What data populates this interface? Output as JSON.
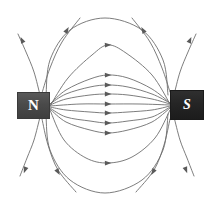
{
  "figure": {
    "background_color": "#ffffff",
    "width": 211,
    "height": 209
  },
  "poles": {
    "north": {
      "label": "N",
      "name": "north-pole",
      "fill_color": "#4a4a4a",
      "text_color": "#ffffff",
      "x": 17,
      "y": 92,
      "width": 33,
      "height": 27
    },
    "south": {
      "label": "S",
      "name": "south-pole",
      "fill_color": "#242424",
      "text_color": "#ffffff",
      "x": 170,
      "y": 90,
      "width": 34,
      "height": 30
    }
  },
  "field": {
    "line_color": "#6e6e6e",
    "line_width": 0.9,
    "arrow_color": "#5a5a5a",
    "direction": "north-to-south",
    "inner_line_count": 7,
    "outer_line_count": 8,
    "open_line_count": 4
  },
  "chart_data": {
    "type": "line",
    "xlabel": "",
    "ylabel": "",
    "xlim": [
      0,
      211
    ],
    "ylim": [
      0,
      209
    ],
    "grid": false,
    "legend": null,
    "annotations": [
      {
        "text": "N",
        "x": 33,
        "y": 106
      },
      {
        "text": "S",
        "x": 187,
        "y": 105
      }
    ],
    "series": [
      {
        "name": "inner-line-1",
        "arrow_at": {
          "x": 108,
          "y": 45
        },
        "points": [
          [
            50,
            106
          ],
          [
            68,
            78
          ],
          [
            92,
            55
          ],
          [
            108,
            45
          ],
          [
            126,
            53
          ],
          [
            152,
            75
          ],
          [
            170,
            104
          ]
        ]
      },
      {
        "name": "inner-line-2",
        "arrow_at": {
          "x": 108,
          "y": 75
        },
        "points": [
          [
            50,
            104
          ],
          [
            66,
            90
          ],
          [
            90,
            79
          ],
          [
            108,
            75
          ],
          [
            128,
            78
          ],
          [
            152,
            89
          ],
          [
            170,
            103
          ]
        ]
      },
      {
        "name": "inner-line-3",
        "arrow_at": {
          "x": 108,
          "y": 85
        },
        "points": [
          [
            50,
            104
          ],
          [
            66,
            94
          ],
          [
            90,
            87
          ],
          [
            108,
            85
          ],
          [
            128,
            87
          ],
          [
            152,
            94
          ],
          [
            170,
            103
          ]
        ]
      },
      {
        "name": "inner-line-4",
        "arrow_at": {
          "x": 108,
          "y": 94
        },
        "points": [
          [
            50,
            105
          ],
          [
            66,
            99
          ],
          [
            90,
            95
          ],
          [
            108,
            94
          ],
          [
            128,
            95
          ],
          [
            152,
            99
          ],
          [
            170,
            104
          ]
        ]
      },
      {
        "name": "inner-line-5",
        "arrow_at": {
          "x": 108,
          "y": 104
        },
        "points": [
          [
            50,
            106
          ],
          [
            80,
            104
          ],
          [
            108,
            104
          ],
          [
            140,
            104
          ],
          [
            170,
            105
          ]
        ]
      },
      {
        "name": "inner-line-6",
        "arrow_at": {
          "x": 108,
          "y": 113
        },
        "points": [
          [
            50,
            107
          ],
          [
            66,
            110
          ],
          [
            90,
            112
          ],
          [
            108,
            113
          ],
          [
            128,
            112
          ],
          [
            152,
            110
          ],
          [
            170,
            106
          ]
        ]
      },
      {
        "name": "inner-line-7",
        "arrow_at": {
          "x": 108,
          "y": 123
        },
        "points": [
          [
            50,
            108
          ],
          [
            66,
            117
          ],
          [
            90,
            121
          ],
          [
            108,
            123
          ],
          [
            128,
            121
          ],
          [
            152,
            117
          ],
          [
            170,
            107
          ]
        ]
      },
      {
        "name": "inner-line-8",
        "arrow_at": {
          "x": 108,
          "y": 133
        },
        "points": [
          [
            50,
            109
          ],
          [
            66,
            122
          ],
          [
            90,
            130
          ],
          [
            108,
            133
          ],
          [
            128,
            130
          ],
          [
            152,
            122
          ],
          [
            170,
            108
          ]
        ]
      },
      {
        "name": "outer-line-upper",
        "arrow_at": {
          "x": 108,
          "y": 163
        },
        "points": [
          [
            50,
            110
          ],
          [
            64,
            140
          ],
          [
            86,
            158
          ],
          [
            108,
            163
          ],
          [
            132,
            157
          ],
          [
            155,
            138
          ],
          [
            170,
            110
          ]
        ]
      },
      {
        "name": "arc-upper-far",
        "arrow_at": null,
        "points": [
          [
            46,
            96
          ],
          [
            50,
            60
          ],
          [
            70,
            30
          ],
          [
            105,
            18
          ],
          [
            142,
            30
          ],
          [
            163,
            60
          ],
          [
            168,
            95
          ]
        ]
      },
      {
        "name": "arc-lower-far",
        "arrow_at": null,
        "points": [
          [
            46,
            116
          ],
          [
            50,
            150
          ],
          [
            70,
            180
          ],
          [
            105,
            193
          ],
          [
            142,
            180
          ],
          [
            163,
            150
          ],
          [
            168,
            114
          ]
        ]
      },
      {
        "name": "open-line-upper-left-outer",
        "arrow_at": {
          "x": 22,
          "y": 40
        },
        "points": [
          [
            40,
            95
          ],
          [
            34,
            72
          ],
          [
            26,
            52
          ],
          [
            18,
            34
          ]
        ]
      },
      {
        "name": "open-line-upper-left-inner",
        "arrow_at": {
          "x": 67,
          "y": 30
        },
        "points": [
          [
            42,
            93
          ],
          [
            50,
            68
          ],
          [
            62,
            42
          ],
          [
            80,
            18
          ]
        ]
      },
      {
        "name": "open-line-upper-right-inner",
        "arrow_at": {
          "x": 143,
          "y": 30
        },
        "points": [
          [
            170,
            92
          ],
          [
            162,
            68
          ],
          [
            150,
            42
          ],
          [
            132,
            18
          ]
        ]
      },
      {
        "name": "open-line-upper-right-outer",
        "arrow_at": {
          "x": 190,
          "y": 40
        },
        "points": [
          [
            174,
            95
          ],
          [
            180,
            72
          ],
          [
            188,
            52
          ],
          [
            196,
            34
          ]
        ]
      },
      {
        "name": "open-line-lower-left-outer",
        "arrow_at": {
          "x": 25,
          "y": 170
        },
        "points": [
          [
            40,
            117
          ],
          [
            34,
            140
          ],
          [
            27,
            158
          ],
          [
            20,
            176
          ]
        ]
      },
      {
        "name": "open-line-lower-left-inner",
        "arrow_at": {
          "x": 58,
          "y": 172
        },
        "points": [
          [
            42,
            119
          ],
          [
            48,
            145
          ],
          [
            58,
            170
          ],
          [
            76,
            192
          ]
        ]
      },
      {
        "name": "open-line-lower-right-inner",
        "arrow_at": {
          "x": 153,
          "y": 172
        },
        "points": [
          [
            170,
            119
          ],
          [
            164,
            145
          ],
          [
            154,
            170
          ],
          [
            136,
            192
          ]
        ]
      },
      {
        "name": "open-line-lower-right-outer",
        "arrow_at": {
          "x": 186,
          "y": 170
        },
        "points": [
          [
            174,
            117
          ],
          [
            180,
            140
          ],
          [
            187,
            158
          ],
          [
            194,
            176
          ]
        ]
      }
    ]
  }
}
